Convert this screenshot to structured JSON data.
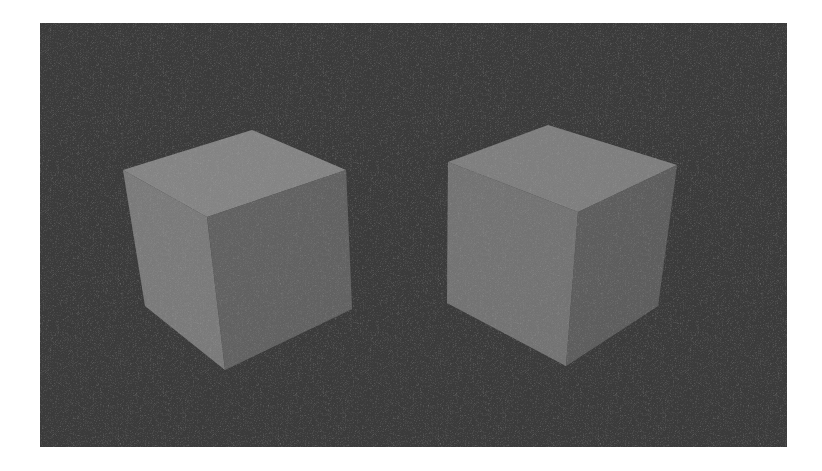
{
  "figure": {
    "canvas": {
      "width": 822,
      "height": 471,
      "background": "#ffffff"
    },
    "panel": {
      "x": 40,
      "y": 23,
      "width": 747,
      "height": 424,
      "color": "#3b3b3b"
    },
    "cubes": [
      {
        "name": "left-cube",
        "faces": {
          "top": {
            "points": "123,170 252,130 346,170 207,217",
            "color": "#858585"
          },
          "left": {
            "points": "123,170 207,217 225,370 145,306",
            "color": "#7b7b7b"
          },
          "right": {
            "points": "207,217 346,170 352,309 225,370",
            "color": "#626262"
          }
        }
      },
      {
        "name": "right-cube",
        "faces": {
          "top": {
            "points": "448,162 548,125 677,165 578,212",
            "color": "#7f7f7f"
          },
          "left": {
            "points": "448,162 578,212 566,366 447,303",
            "color": "#747474"
          },
          "right": {
            "points": "578,212 677,165 658,306 566,366",
            "color": "#5e5e5e"
          }
        }
      }
    ]
  }
}
